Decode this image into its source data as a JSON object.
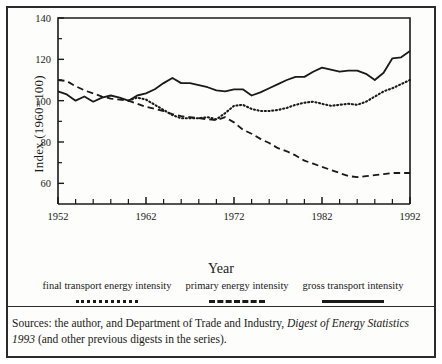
{
  "figure": {
    "axis_title_x": "Year",
    "axis_title_y": "Index (1960=100)",
    "source_text_part1": "Sources: the author, and Department of Trade and Industry, ",
    "source_text_italic": "Digest of Energy Statistics 1993",
    "source_text_part2": " (and other previous digests in the series)."
  },
  "legend": {
    "items": [
      {
        "label": "final transport energy intensity",
        "style": "dotted"
      },
      {
        "label": "primary energy intensity",
        "style": "dashed"
      },
      {
        "label": "gross transport intensity",
        "style": "solid"
      }
    ]
  },
  "chart_data": {
    "type": "line",
    "title": "",
    "xlabel": "Year",
    "ylabel": "Index (1960=100)",
    "xlim": [
      1952,
      1992
    ],
    "ylim": [
      50,
      140
    ],
    "grid": false,
    "legend_position": "below-axis",
    "ytick_labels": [
      "60",
      "80",
      "100",
      "120",
      "140"
    ],
    "yticks": [
      60,
      80,
      100,
      120,
      140
    ],
    "yticks_minor": [
      70,
      90,
      110,
      130
    ],
    "xtick_labels": [
      "1952",
      "1962",
      "1972",
      "1982",
      "1992"
    ],
    "xticks": [
      1952,
      1962,
      1972,
      1982,
      1992
    ],
    "xticks_minor_step": 2,
    "x": [
      1952,
      1953,
      1954,
      1955,
      1956,
      1957,
      1958,
      1959,
      1960,
      1961,
      1962,
      1963,
      1964,
      1965,
      1966,
      1967,
      1968,
      1969,
      1970,
      1971,
      1972,
      1973,
      1974,
      1975,
      1976,
      1977,
      1978,
      1979,
      1980,
      1981,
      1982,
      1983,
      1984,
      1985,
      1986,
      1987,
      1988,
      1989,
      1990,
      1991,
      1992
    ],
    "series": [
      {
        "name": "gross transport intensity",
        "style": "solid",
        "values": [
          104.5,
          103.0,
          100.0,
          102.0,
          99.5,
          101.5,
          102.5,
          101.5,
          100.0,
          102.5,
          103.5,
          105.5,
          108.5,
          111.0,
          108.5,
          108.5,
          107.5,
          106.5,
          105.0,
          104.5,
          105.5,
          105.5,
          102.5,
          104.0,
          106.0,
          108.0,
          110.0,
          111.5,
          111.5,
          114.0,
          116.0,
          115.0,
          114.0,
          114.5,
          114.5,
          113.0,
          110.0,
          113.5,
          120.5,
          121.0,
          124.0
        ]
      },
      {
        "name": "final transport energy intensity",
        "style": "dotted",
        "values": [
          null,
          null,
          null,
          null,
          null,
          null,
          null,
          null,
          100.0,
          101.5,
          100.5,
          98.0,
          95.5,
          93.0,
          91.5,
          91.5,
          91.5,
          92.0,
          91.0,
          94.0,
          97.5,
          98.0,
          96.0,
          95.0,
          95.0,
          95.5,
          96.5,
          98.0,
          99.0,
          99.5,
          98.5,
          97.5,
          98.0,
          98.5,
          98.0,
          99.5,
          102.0,
          104.5,
          106.0,
          108.0,
          110.0
        ]
      },
      {
        "name": "primary energy intensity",
        "style": "dashed",
        "values": [
          110.0,
          109.5,
          107.0,
          105.0,
          103.5,
          102.0,
          101.0,
          100.5,
          100.0,
          98.5,
          97.0,
          96.0,
          95.0,
          93.5,
          92.5,
          92.0,
          91.5,
          91.0,
          90.5,
          92.0,
          89.5,
          86.0,
          84.0,
          81.5,
          79.5,
          77.0,
          75.5,
          73.5,
          71.0,
          69.5,
          68.0,
          66.5,
          65.0,
          63.5,
          63.0,
          63.5,
          64.0,
          64.5,
          65.0,
          65.0,
          65.0
        ]
      }
    ]
  }
}
